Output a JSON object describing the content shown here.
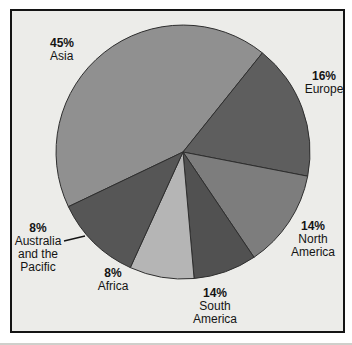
{
  "figure": {
    "panel_background": "#ecece9",
    "frame_border_color": "#141414",
    "outer_margin_color": "#ffffff"
  },
  "chart_data": {
    "type": "pie",
    "title": "",
    "legend_position": "outside-labels",
    "center": {
      "x": 183,
      "y": 152
    },
    "radius": 127,
    "outline_color": "#2e2e2e",
    "categories": [
      "Asia",
      "Europe",
      "North America",
      "South America",
      "Africa",
      "Australia and the Pacific"
    ],
    "values": [
      45,
      16,
      14,
      14,
      8,
      8
    ],
    "slices": [
      {
        "id": "asia",
        "label": "Asia",
        "name_lines": [
          "Asia"
        ],
        "percent_label": "45%",
        "value": 45,
        "color": "#909090",
        "start_angle": 244.5,
        "end_angle": 398.7,
        "callout": false
      },
      {
        "id": "europe",
        "label": "Europe",
        "name_lines": [
          "Europe"
        ],
        "percent_label": "16%",
        "value": 16,
        "color": "#5e5e5e",
        "start_angle": 38.7,
        "end_angle": 101,
        "callout": false
      },
      {
        "id": "north-america",
        "label": "North America",
        "name_lines": [
          "North",
          "America"
        ],
        "percent_label": "14%",
        "value": 14,
        "color": "#7d7d7d",
        "start_angle": 101,
        "end_angle": 146,
        "callout": false
      },
      {
        "id": "south-america",
        "label": "South America",
        "name_lines": [
          "South",
          "America"
        ],
        "percent_label": "14%",
        "value": 14,
        "color": "#515151",
        "start_angle": 146,
        "end_angle": 175,
        "callout": false
      },
      {
        "id": "africa",
        "label": "Africa",
        "name_lines": [
          "Africa"
        ],
        "percent_label": "8%",
        "value": 8,
        "color": "#b5b5b5",
        "start_angle": 175,
        "end_angle": 204.5,
        "callout": false
      },
      {
        "id": "australia",
        "label": "Australia and the Pacific",
        "name_lines": [
          "Australia",
          "and the",
          "Pacific"
        ],
        "percent_label": "8%",
        "value": 8,
        "color": "#565656",
        "start_angle": 204.5,
        "end_angle": 244.5,
        "callout": true
      }
    ]
  }
}
